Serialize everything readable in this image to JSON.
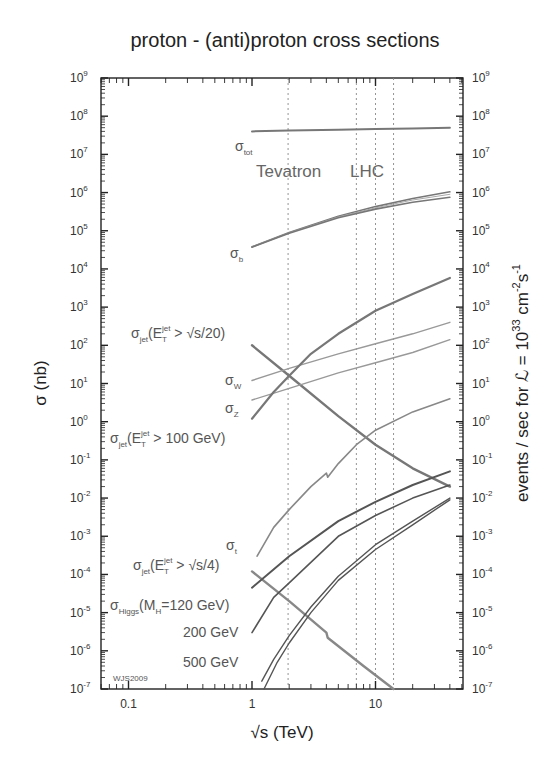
{
  "chart_data": {
    "type": "line",
    "title": "proton - (anti)proton cross sections",
    "xlabel": "√s (TeV)",
    "ylabel": "σ (nb)",
    "y2label": "events / sec for ℒ = 10^33 cm^-2 s^-1",
    "xscale": "log",
    "yscale": "log",
    "xlim": [
      0.058,
      51
    ],
    "ylim": [
      1e-07,
      1000000000.0
    ],
    "x_ticks": [
      {
        "value": 0.1,
        "label": "0.1"
      },
      {
        "value": 1,
        "label": "1"
      },
      {
        "value": 10,
        "label": "10"
      }
    ],
    "y_ticks": [
      {
        "exp": "9"
      },
      {
        "exp": "8"
      },
      {
        "exp": "7"
      },
      {
        "exp": "6"
      },
      {
        "exp": "5"
      },
      {
        "exp": "4"
      },
      {
        "exp": "3"
      },
      {
        "exp": "2"
      },
      {
        "exp": "1"
      },
      {
        "exp": "0"
      },
      {
        "exp": "-1"
      },
      {
        "exp": "-2"
      },
      {
        "exp": "-3"
      },
      {
        "exp": "-4"
      },
      {
        "exp": "-5"
      },
      {
        "exp": "-6"
      },
      {
        "exp": "-7"
      }
    ],
    "y2_ticks_same_as_y": true,
    "grid": false,
    "vertical_markers": [
      {
        "x": 1.96,
        "group": "Tevatron"
      },
      {
        "x": 7,
        "group": "LHC"
      },
      {
        "x": 10,
        "group": "LHC"
      },
      {
        "x": 14,
        "group": "LHC"
      }
    ],
    "annotations": [
      {
        "text": "Tevatron",
        "x": 1.3,
        "y": 15000000.0
      },
      {
        "text": "LHC",
        "x": 6.5,
        "y": 15000000.0
      },
      {
        "text": "WJS2009",
        "x": 0.065,
        "y": 2e-07
      }
    ],
    "series": [
      {
        "name": "σ_tot",
        "label": "σ",
        "sub": "tot",
        "color": "#777777",
        "width": 2,
        "x": [
          1,
          2,
          5,
          10,
          20,
          40
        ],
        "y": [
          40000000.0,
          42000000.0,
          44000000.0,
          46000000.0,
          48000000.0,
          50000000.0
        ],
        "label_pos": [
          235,
          151
        ]
      },
      {
        "name": "σ_b (upper)",
        "label": "σ",
        "sub": "b",
        "color": "#777777",
        "width": 1.6,
        "x": [
          1,
          2,
          5,
          10,
          20,
          40
        ],
        "y": [
          38000.0,
          90000.0,
          240000.0,
          430000.0,
          700000.0,
          1050000.0
        ],
        "label_pos": [
          230,
          258
        ]
      },
      {
        "name": "σ_b (middle)",
        "color": "#aaaaaa",
        "width": 1,
        "x": [
          1,
          2,
          5,
          10,
          20,
          40
        ],
        "y": [
          38000.0,
          88000.0,
          230000.0,
          400000.0,
          640000.0,
          900000.0
        ]
      },
      {
        "name": "σ_b (lower)",
        "color": "#777777",
        "width": 1.6,
        "x": [
          1,
          2,
          5,
          10,
          20,
          40
        ],
        "y": [
          37000.0,
          86000.0,
          220000.0,
          370000.0,
          560000.0,
          750000.0
        ]
      },
      {
        "name": "σ_jet(E_T^jet > √s/20)",
        "label": "σ",
        "sub": "jet",
        "expr": "(E",
        "subT": "T",
        "supjet": "jet",
        "tail": " > √s/20)",
        "color": "#777777",
        "width": 2.4,
        "x": [
          1,
          2,
          5,
          10,
          20,
          40
        ],
        "y": [
          100,
          16,
          1.4,
          0.25,
          0.06,
          0.02
        ],
        "label_pos": [
          131,
          338
        ]
      },
      {
        "name": "σ_W",
        "label": "σ",
        "sub": "W",
        "color": "#999999",
        "width": 1.4,
        "x": [
          1,
          2,
          5,
          10,
          20,
          40
        ],
        "y": [
          12,
          25,
          60,
          110,
          200,
          400
        ],
        "label_pos": [
          225,
          385
        ]
      },
      {
        "name": "σ_Z",
        "label": "σ",
        "sub": "Z",
        "color": "#999999",
        "width": 1.4,
        "x": [
          1,
          2,
          5,
          10,
          20,
          40
        ],
        "y": [
          3.7,
          7.5,
          19,
          35,
          65,
          140
        ],
        "label_pos": [
          225,
          413
        ]
      },
      {
        "name": "σ_jet(E_T^jet > 100 GeV)",
        "label": "σ",
        "sub": "jet",
        "expr": "(E",
        "subT": "T",
        "supjet": "jet",
        "tail": " > 100 GeV)",
        "color": "#777777",
        "width": 2.2,
        "x": [
          1,
          1.5,
          2,
          3,
          5,
          10,
          20,
          40
        ],
        "y": [
          1.2,
          6,
          16,
          60,
          200,
          800,
          2200,
          5800
        ],
        "label_pos": [
          110,
          443
        ]
      },
      {
        "name": "σ_t",
        "label": "σ",
        "sub": "t",
        "color": "#888888",
        "width": 1.6,
        "x": [
          1.1,
          1.5,
          2,
          3,
          4,
          4.1,
          5,
          7,
          10,
          20,
          40
        ],
        "y": [
          0.0003,
          0.0017,
          0.005,
          0.02,
          0.045,
          0.035,
          0.08,
          0.25,
          0.6,
          1.8,
          4.0
        ],
        "label_pos": [
          226,
          550
        ]
      },
      {
        "name": "σ_jet(E_T^jet > √s/4)",
        "label": "σ",
        "sub": "jet",
        "expr": "(E",
        "subT": "T",
        "supjet": "jet",
        "tail": " > √s/4)",
        "color": "#888888",
        "width": 2.4,
        "x": [
          1,
          2,
          4,
          4.1,
          8,
          14
        ],
        "y": [
          0.00012,
          2e-05,
          3e-06,
          2.2e-06,
          4e-07,
          1e-07
        ],
        "label_pos": [
          133,
          570
        ]
      },
      {
        "name": "σ_Higgs(M_H=120 GeV)",
        "label": "σ",
        "sub": "Higgs",
        "tail": "(M",
        "subH": "H",
        "tail2": "=120 GeV)",
        "color": "#555555",
        "width": 2.0,
        "x": [
          1,
          2,
          5,
          10,
          20,
          40
        ],
        "y": [
          4.5e-05,
          0.0003,
          0.0025,
          0.008,
          0.022,
          0.05
        ],
        "label_pos": [
          110,
          610
        ]
      },
      {
        "name": "σ_Higgs(M_H=200 GeV)",
        "label": "200 GeV",
        "color": "#555555",
        "width": 1.6,
        "x": [
          1,
          1.5,
          2,
          5,
          10,
          20,
          40
        ],
        "y": [
          3e-06,
          2.5e-05,
          6e-05,
          0.001,
          0.0035,
          0.01,
          0.022
        ],
        "label_pos": [
          183,
          637
        ]
      },
      {
        "name": "σ_Higgs(M_H=500 GeV) a",
        "label": "500 GeV",
        "color": "#555555",
        "width": 1.4,
        "x": [
          1.2,
          1.5,
          2,
          3,
          5,
          10,
          20,
          40
        ],
        "y": [
          1.6e-07,
          6e-07,
          2.5e-06,
          1.4e-05,
          9e-05,
          0.0006,
          0.0025,
          0.01
        ],
        "label_pos": [
          183,
          667
        ]
      },
      {
        "name": "σ_Higgs(M_H=500 GeV) b",
        "color": "#555555",
        "width": 1.4,
        "x": [
          1.25,
          1.6,
          2,
          3,
          5,
          10,
          20,
          40
        ],
        "y": [
          1e-07,
          5e-07,
          1.6e-06,
          1e-05,
          7e-05,
          0.00045,
          0.002,
          0.009
        ]
      }
    ]
  }
}
